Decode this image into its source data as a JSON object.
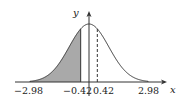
{
  "chart_data": {
    "type": "area",
    "title": "",
    "xlabel": "x",
    "ylabel": "y",
    "x_range": [
      -2.98,
      2.98
    ],
    "shaded_region": {
      "from": -2.98,
      "to": -0.42,
      "color": "#a9a9a9"
    },
    "marker_lines": [
      {
        "x": -0.42,
        "style": "solid"
      },
      {
        "x": 0.42,
        "style": "dashed"
      }
    ],
    "tick_labels": [
      "-2.98",
      "-0.42",
      "0.42",
      "2.98"
    ],
    "grid": false
  },
  "labels": {
    "x_axis": "x",
    "y_axis": "y",
    "t1": "−2.98",
    "t2": "−0.42",
    "t3": "0.42",
    "t4": "2.98"
  },
  "colors": {
    "shade": "#a9a9a9",
    "line": "#333333"
  }
}
